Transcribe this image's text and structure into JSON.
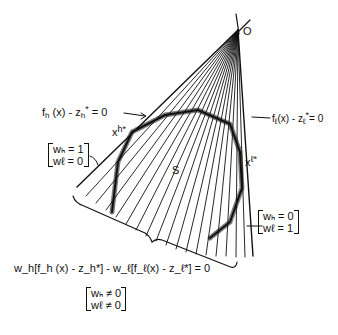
{
  "diagram": {
    "origin_label": "O",
    "region_label": "S",
    "point_h": {
      "base": "x",
      "sup": "h*"
    },
    "point_l": {
      "base": "x",
      "sup": "ℓ*"
    },
    "line_h": {
      "text": "f_h (x) - z_h* = 0",
      "f": "f",
      "fsub": "h",
      "mid": " (x) - z",
      "zsub": "h",
      "zsup": "*",
      "end": " = 0"
    },
    "line_l": {
      "text": "f_ℓ(x) - z_ℓ* = 0",
      "f": "f",
      "fsub": "ℓ",
      "mid": "(x) - z",
      "zsub": "ℓ",
      "zsup": "*",
      "end": "= 0"
    },
    "weights_h": {
      "row1": "wₕ = 1",
      "row2": "wℓ = 0"
    },
    "weights_l": {
      "row1": "wₕ = 0",
      "row2": "wℓ = 1"
    },
    "combined_equation": "w_h[f_h (x) - z_h*] - w_ℓ[f_ℓ(x) - z_ℓ*] = 0",
    "weights_mixed": {
      "row1": "wₕ ≠ 0",
      "row2": "wℓ ≠ 0"
    },
    "colors": {
      "ink": "#111111",
      "background": "#ffffff"
    }
  }
}
